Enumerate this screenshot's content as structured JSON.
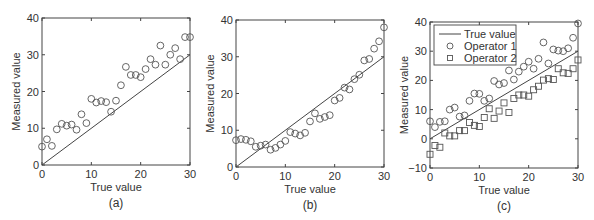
{
  "chart_data": [
    {
      "type": "scatter",
      "panel_label": "(a)",
      "xlabel": "True value",
      "ylabel": "Measured value",
      "xlim": [
        0,
        30
      ],
      "ylim": [
        0,
        40
      ],
      "xticks": [
        0,
        10,
        20,
        30
      ],
      "yticks": [
        0,
        10,
        20,
        30,
        40
      ],
      "grid": false,
      "reference_line": {
        "name": "True value",
        "x": [
          0,
          30
        ],
        "y": [
          0,
          30
        ]
      },
      "series": [
        {
          "name": "Measured",
          "marker": "circle",
          "x": [
            0,
            1,
            2,
            3,
            4,
            5,
            6,
            7,
            8,
            9,
            10,
            11,
            12,
            13,
            14,
            15,
            16,
            17,
            18,
            19,
            20,
            21,
            22,
            23,
            24,
            25,
            26,
            27,
            28,
            29,
            30
          ],
          "values": [
            5,
            7,
            5.2,
            9.7,
            11.2,
            10.7,
            11,
            9.6,
            13.8,
            11.4,
            18,
            17,
            17.4,
            17.1,
            14.5,
            17.5,
            21.7,
            26.7,
            24.5,
            24.5,
            23.9,
            26.1,
            28.8,
            27.3,
            32.5,
            27.3,
            30,
            31.8,
            28.8,
            34.8,
            34.8
          ]
        }
      ]
    },
    {
      "type": "scatter",
      "panel_label": "(b)",
      "xlabel": "True value",
      "ylabel": "Measured value",
      "xlim": [
        0,
        30
      ],
      "ylim": [
        0,
        40
      ],
      "xticks": [
        0,
        10,
        20,
        30
      ],
      "yticks": [
        0,
        10,
        20,
        30,
        40
      ],
      "grid": false,
      "reference_line": {
        "name": "True value",
        "x": [
          0,
          30
        ],
        "y": [
          0,
          30
        ]
      },
      "series": [
        {
          "name": "Measured",
          "marker": "circle",
          "x": [
            0,
            1,
            2,
            3,
            4,
            5,
            6,
            7,
            8,
            9,
            10,
            11,
            12,
            13,
            14,
            15,
            16,
            17,
            18,
            19,
            20,
            21,
            22,
            23,
            24,
            25,
            26,
            27,
            28,
            29,
            30
          ],
          "values": [
            7.3,
            7.6,
            7.4,
            7,
            5.5,
            5.8,
            6.1,
            4.7,
            5.2,
            6.1,
            7.1,
            9.5,
            9.1,
            8.6,
            9.3,
            12.4,
            14.6,
            13.1,
            13.6,
            14.1,
            18.1,
            18.8,
            21.6,
            21.1,
            23.9,
            25.1,
            29,
            29.4,
            32.2,
            34.2,
            38
          ]
        }
      ]
    },
    {
      "type": "scatter",
      "panel_label": "(c)",
      "xlabel": "True value",
      "ylabel": "Measured value",
      "xlim": [
        0,
        30
      ],
      "ylim": [
        -10,
        40
      ],
      "xticks": [
        0,
        10,
        20,
        30
      ],
      "yticks": [
        -10,
        0,
        10,
        20,
        30,
        40
      ],
      "grid": false,
      "legend_position": "upper left",
      "legend": [
        "True value",
        "Operator 1",
        "Operator 2"
      ],
      "reference_line": {
        "name": "True value",
        "x": [
          0,
          30
        ],
        "y": [
          0,
          30
        ]
      },
      "series": [
        {
          "name": "Operator 1",
          "marker": "circle",
          "x": [
            0,
            1,
            2,
            3,
            4,
            5,
            6,
            7,
            8,
            9,
            10,
            11,
            12,
            13,
            14,
            15,
            16,
            17,
            18,
            19,
            20,
            21,
            22,
            23,
            24,
            25,
            26,
            27,
            28,
            29,
            30
          ],
          "values": [
            6,
            4,
            5.8,
            6,
            10,
            10.7,
            7.6,
            8,
            13,
            15.5,
            15.4,
            13,
            13.8,
            19.8,
            18.6,
            19.1,
            23.4,
            20.3,
            23,
            24.7,
            26.4,
            24,
            27.4,
            33,
            25.8,
            30.6,
            30.2,
            30,
            31,
            34.6,
            39.5
          ]
        },
        {
          "name": "Operator 2",
          "marker": "square",
          "x": [
            0,
            1,
            2,
            3,
            4,
            5,
            6,
            7,
            8,
            9,
            10,
            11,
            12,
            13,
            14,
            15,
            16,
            17,
            18,
            19,
            20,
            21,
            22,
            23,
            24,
            25,
            26,
            27,
            28,
            29,
            30
          ],
          "values": [
            -5.3,
            -2.3,
            -2.9,
            2,
            1,
            1,
            2.8,
            2.8,
            5.6,
            4.6,
            4.2,
            7.3,
            10.3,
            7,
            9.5,
            12.3,
            9,
            13.8,
            15,
            15,
            14.6,
            16.8,
            18,
            20.1,
            20.6,
            20.3,
            24,
            22.6,
            22.4,
            24,
            27
          ]
        }
      ]
    }
  ],
  "colors": {
    "axes": "#444444",
    "marker": "#555555",
    "line": "#444444",
    "text": "#333333"
  }
}
